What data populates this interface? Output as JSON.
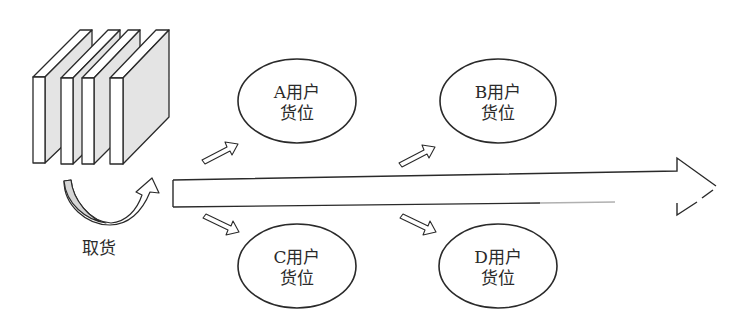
{
  "diagram": {
    "colors": {
      "stroke": "#2a2a2a",
      "panel_shade": "#e4e4e4",
      "background": "#ffffff"
    },
    "pickup": {
      "label": "取货",
      "icon": "book-stack-icon"
    },
    "main_arrow": {
      "direction": "right"
    },
    "nodes": [
      {
        "id": "A",
        "line1": "A用户",
        "line2": "货位"
      },
      {
        "id": "B",
        "line1": "B用户",
        "line2": "货位"
      },
      {
        "id": "C",
        "line1": "C用户",
        "line2": "货位"
      },
      {
        "id": "D",
        "line1": "D用户",
        "line2": "货位"
      }
    ]
  }
}
